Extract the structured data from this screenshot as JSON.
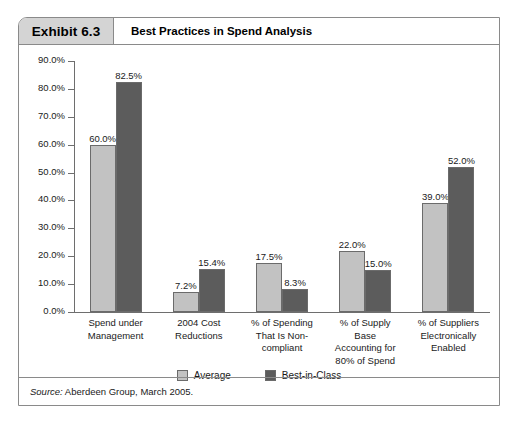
{
  "exhibit": {
    "number_label": "Exhibit 6.3",
    "title": "Best Practices in Spend Analysis",
    "source_prefix": "Source:",
    "source_body": " Aberdeen Group, March 2005."
  },
  "colors": {
    "average": "#c2c2c2",
    "best_in_class": "#5c5c5c",
    "header_box": "#d4d4d4",
    "frame_border": "#8a8a8a",
    "axis": "#6e6e6e"
  },
  "chart_data": {
    "type": "bar",
    "title": "Best Practices in Spend Analysis",
    "xlabel": "",
    "ylabel": "",
    "ylim": [
      0,
      90
    ],
    "grid": false,
    "legend_position": "bottom",
    "ytick_labels": [
      "90.0%",
      "80.0%",
      "70.0%",
      "60.0%",
      "50.0%",
      "40.0%",
      "30.0%",
      "20.0%",
      "10.0%",
      "0.0%"
    ],
    "ytick_values": [
      90,
      80,
      70,
      60,
      50,
      40,
      30,
      20,
      10,
      0
    ],
    "categories": [
      "Spend under\nManagement",
      "2004 Cost\nReductions",
      "% of Spending\nThat Is Non-\ncompliant",
      "% of Supply\nBase\nAccounting for\n80% of Spend",
      "% of Suppliers\nElectronically\nEnabled"
    ],
    "series": [
      {
        "name": "Average",
        "values": [
          60.0,
          7.2,
          17.5,
          22.0,
          39.0
        ],
        "labels": [
          "60.0%",
          "7.2%",
          "17.5%",
          "22.0%",
          "39.0%"
        ]
      },
      {
        "name": "Best-in-Class",
        "values": [
          82.5,
          15.4,
          8.3,
          15.0,
          52.0
        ],
        "labels": [
          "82.5%",
          "15.4%",
          "8.3%",
          "15.0%",
          "52.0%"
        ]
      }
    ]
  }
}
